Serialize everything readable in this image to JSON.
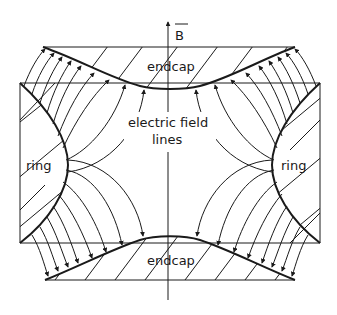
{
  "diagram": {
    "labels": {
      "magnetic_field": "B",
      "endcap_top": "endcap",
      "endcap_bottom": "endcap",
      "ring_left": "ring",
      "ring_right": "ring",
      "field_lines_1": "electric field",
      "field_lines_2": "lines"
    },
    "colors": {
      "ink": "#1a1a1a",
      "background": "#ffffff"
    }
  }
}
